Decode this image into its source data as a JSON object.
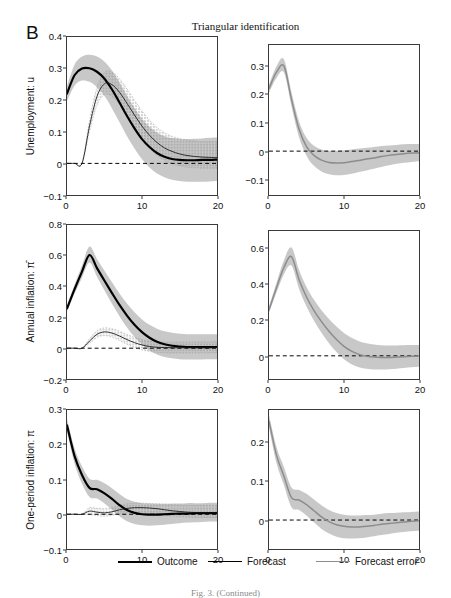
{
  "figure": {
    "panel_letter": "B",
    "title": "Triangular identification",
    "caption": "Fig. 3. (Continued)"
  },
  "legend": {
    "items": [
      {
        "label": "Outcome",
        "style": "thick-black",
        "color": "#000000"
      },
      {
        "label": "Forecast",
        "style": "thin-black",
        "color": "#000000"
      },
      {
        "label": "Forecast error",
        "style": "gray",
        "color": "#8c8c8c"
      }
    ]
  },
  "colors": {
    "outcome": "#000000",
    "forecast": "#1a1a1a",
    "error": "#8c8c8c",
    "band_solid": "#b9b9b9",
    "band_dotted": "#cfcfcf",
    "zero_line": "#000000",
    "frame": "#3a3a3a"
  },
  "chart_data": [
    {
      "id": "unemployment-outcome-forecast",
      "type": "line",
      "row": 0,
      "col": 0,
      "title": "",
      "ylabel": "Unemployment: u",
      "xlabel": "",
      "xlim": [
        0,
        20
      ],
      "ylim": [
        -0.1,
        0.4
      ],
      "xticks": [
        0,
        10,
        20
      ],
      "yticks": [
        -0.1,
        0,
        0.1,
        0.2,
        0.3,
        0.4
      ],
      "ytick_labels": [
        "−0.1",
        "0",
        "0.1",
        "0.2",
        "0.3",
        "0.4"
      ],
      "grid": false,
      "zero_line": true,
      "x": [
        0,
        1,
        2,
        3,
        4,
        5,
        6,
        7,
        8,
        9,
        10,
        11,
        12,
        13,
        14,
        15,
        16,
        17,
        18,
        19,
        20
      ],
      "series": [
        {
          "name": "Outcome",
          "style": "thick-black",
          "values": [
            0.221,
            0.279,
            0.3,
            0.301,
            0.29,
            0.268,
            0.234,
            0.193,
            0.15,
            0.111,
            0.077,
            0.052,
            0.033,
            0.021,
            0.014,
            0.011,
            0.01,
            0.01,
            0.011,
            0.011,
            0.012
          ],
          "band": {
            "type": "solid",
            "lower": [
              0.198,
              0.246,
              0.262,
              0.258,
              0.241,
              0.213,
              0.174,
              0.13,
              0.086,
              0.047,
              0.013,
              -0.013,
              -0.032,
              -0.044,
              -0.052,
              -0.056,
              -0.058,
              -0.058,
              -0.058,
              -0.057,
              -0.056
            ],
            "upper": [
              0.245,
              0.312,
              0.338,
              0.344,
              0.338,
              0.322,
              0.294,
              0.256,
              0.214,
              0.175,
              0.141,
              0.116,
              0.098,
              0.086,
              0.08,
              0.077,
              0.077,
              0.078,
              0.079,
              0.081,
              0.082
            ]
          }
        },
        {
          "name": "Forecast",
          "style": "thin-black",
          "values": [
            0.0,
            0.0,
            0.0,
            0.118,
            0.212,
            0.252,
            0.249,
            0.225,
            0.19,
            0.153,
            0.118,
            0.089,
            0.066,
            0.049,
            0.038,
            0.03,
            0.025,
            0.022,
            0.02,
            0.019,
            0.018
          ],
          "band": {
            "type": "dotted",
            "lower": [
              0.0,
              0.0,
              0.0,
              0.1,
              0.184,
              0.218,
              0.212,
              0.186,
              0.15,
              0.112,
              0.077,
              0.048,
              0.026,
              0.01,
              -0.001,
              -0.008,
              -0.012,
              -0.014,
              -0.015,
              -0.015,
              -0.015
            ],
            "upper": [
              0.0,
              0.0,
              0.0,
              0.136,
              0.241,
              0.288,
              0.289,
              0.268,
              0.236,
              0.2,
              0.166,
              0.137,
              0.114,
              0.097,
              0.086,
              0.079,
              0.074,
              0.071,
              0.069,
              0.069,
              0.069
            ]
          }
        }
      ]
    },
    {
      "id": "unemployment-forecast-error",
      "type": "line",
      "row": 0,
      "col": 1,
      "title": "",
      "ylabel": "",
      "xlabel": "",
      "xlim": [
        0,
        20
      ],
      "ylim": [
        -0.155,
        0.375
      ],
      "xticks": [
        0,
        10,
        20
      ],
      "yticks": [
        -0.1,
        0,
        0.1,
        0.2,
        0.3
      ],
      "ytick_labels": [
        "−0.1",
        "0",
        "0.1",
        "0.2",
        "0.3"
      ],
      "grid": false,
      "zero_line": true,
      "x": [
        0,
        1,
        2,
        3,
        4,
        5,
        6,
        7,
        8,
        9,
        10,
        11,
        12,
        13,
        14,
        15,
        16,
        17,
        18,
        19,
        20
      ],
      "series": [
        {
          "name": "Forecast error",
          "style": "gray",
          "values": [
            0.221,
            0.279,
            0.3,
            0.183,
            0.078,
            0.016,
            -0.015,
            -0.032,
            -0.04,
            -0.042,
            -0.041,
            -0.037,
            -0.033,
            -0.028,
            -0.024,
            -0.019,
            -0.015,
            -0.012,
            -0.009,
            -0.007,
            -0.006
          ],
          "band": {
            "type": "solid",
            "lower": [
              0.206,
              0.258,
              0.277,
              0.158,
              0.05,
              -0.016,
              -0.052,
              -0.072,
              -0.082,
              -0.085,
              -0.084,
              -0.08,
              -0.074,
              -0.068,
              -0.062,
              -0.056,
              -0.05,
              -0.045,
              -0.041,
              -0.038,
              -0.036
            ],
            "upper": [
              0.236,
              0.3,
              0.324,
              0.208,
              0.106,
              0.047,
              0.019,
              0.006,
              0.001,
              0.001,
              0.003,
              0.006,
              0.009,
              0.012,
              0.015,
              0.018,
              0.02,
              0.022,
              0.024,
              0.025,
              0.025
            ]
          }
        }
      ]
    },
    {
      "id": "annual-inflation-outcome-forecast",
      "type": "line",
      "row": 1,
      "col": 0,
      "title": "",
      "ylabel": "Annual inflation: π̄",
      "xlabel": "",
      "xlim": [
        0,
        20
      ],
      "ylim": [
        -0.2,
        0.8
      ],
      "xticks": [
        0,
        10,
        20
      ],
      "yticks": [
        -0.2,
        0,
        0.2,
        0.4,
        0.6,
        0.8
      ],
      "ytick_labels": [
        "−0.2",
        "0",
        "0.2",
        "0.4",
        "0.6",
        "0.8"
      ],
      "grid": false,
      "zero_line": true,
      "x": [
        0,
        1,
        2,
        3,
        4,
        5,
        6,
        7,
        8,
        9,
        10,
        11,
        12,
        13,
        14,
        15,
        16,
        17,
        18,
        19,
        20
      ],
      "series": [
        {
          "name": "Outcome",
          "style": "thick-black",
          "values": [
            0.258,
            0.382,
            0.497,
            0.605,
            0.52,
            0.438,
            0.358,
            0.281,
            0.212,
            0.152,
            0.104,
            0.068,
            0.042,
            0.026,
            0.016,
            0.011,
            0.008,
            0.007,
            0.007,
            0.007,
            0.008
          ],
          "band": {
            "type": "solid",
            "lower": [
              0.238,
              0.353,
              0.458,
              0.556,
              0.464,
              0.375,
              0.289,
              0.208,
              0.134,
              0.072,
              0.022,
              -0.015,
              -0.041,
              -0.057,
              -0.066,
              -0.071,
              -0.073,
              -0.073,
              -0.073,
              -0.072,
              -0.071
            ],
            "upper": [
              0.278,
              0.412,
              0.537,
              0.66,
              0.58,
              0.503,
              0.428,
              0.355,
              0.29,
              0.233,
              0.187,
              0.152,
              0.127,
              0.11,
              0.1,
              0.094,
              0.091,
              0.09,
              0.09,
              0.09,
              0.091
            ]
          }
        },
        {
          "name": "Forecast",
          "style": "thin-black",
          "values": [
            0.0,
            0.0,
            0.0,
            0.046,
            0.09,
            0.106,
            0.098,
            0.079,
            0.056,
            0.036,
            0.021,
            0.011,
            0.006,
            0.004,
            0.003,
            0.003,
            0.003,
            0.004,
            0.004,
            0.004,
            0.005
          ],
          "band": {
            "type": "dotted",
            "lower": [
              0.0,
              0.0,
              0.0,
              0.032,
              0.07,
              0.082,
              0.072,
              0.05,
              0.026,
              0.005,
              -0.011,
              -0.021,
              -0.027,
              -0.03,
              -0.031,
              -0.031,
              -0.031,
              -0.03,
              -0.03,
              -0.03,
              -0.03
            ],
            "upper": [
              0.0,
              0.0,
              0.0,
              0.062,
              0.114,
              0.132,
              0.126,
              0.11,
              0.089,
              0.07,
              0.056,
              0.047,
              0.042,
              0.04,
              0.039,
              0.039,
              0.04,
              0.04,
              0.041,
              0.041,
              0.042
            ]
          }
        }
      ]
    },
    {
      "id": "annual-inflation-forecast-error",
      "type": "line",
      "row": 1,
      "col": 1,
      "title": "",
      "ylabel": "",
      "xlabel": "",
      "xlim": [
        -0.13,
        0.7
      ],
      "ylim": [
        -0.13,
        0.7
      ],
      "xticks": [
        0,
        10,
        20
      ],
      "yticks": [
        0,
        0.2,
        0.4,
        0.6
      ],
      "ytick_labels": [
        "0",
        "0.2",
        "0.4",
        "0.6"
      ],
      "grid": false,
      "zero_line": true,
      "x": [
        0,
        1,
        2,
        3,
        4,
        5,
        6,
        7,
        8,
        9,
        10,
        11,
        12,
        13,
        14,
        15,
        16,
        17,
        18,
        19,
        20
      ],
      "series": [
        {
          "name": "Forecast error",
          "style": "gray",
          "values": [
            0.258,
            0.382,
            0.497,
            0.556,
            0.428,
            0.33,
            0.254,
            0.192,
            0.138,
            0.091,
            0.053,
            0.026,
            0.008,
            -0.002,
            -0.007,
            -0.009,
            -0.009,
            -0.007,
            -0.005,
            -0.003,
            -0.001
          ],
          "band": {
            "type": "solid",
            "lower": [
              0.24,
              0.355,
              0.458,
              0.506,
              0.376,
              0.276,
              0.197,
              0.13,
              0.071,
              0.021,
              -0.019,
              -0.047,
              -0.064,
              -0.073,
              -0.077,
              -0.077,
              -0.075,
              -0.072,
              -0.068,
              -0.064,
              -0.061
            ],
            "upper": [
              0.276,
              0.41,
              0.538,
              0.608,
              0.482,
              0.386,
              0.314,
              0.256,
              0.207,
              0.164,
              0.128,
              0.101,
              0.082,
              0.07,
              0.063,
              0.059,
              0.058,
              0.058,
              0.059,
              0.06,
              0.061
            ]
          }
        }
      ]
    },
    {
      "id": "one-period-inflation-outcome-forecast",
      "type": "line",
      "row": 2,
      "col": 0,
      "title": "",
      "ylabel": "One-period inflation: π",
      "xlabel": "",
      "xlim": [
        0,
        20
      ],
      "ylim": [
        -0.1,
        0.3
      ],
      "xticks": [
        0,
        10,
        20
      ],
      "yticks": [
        -0.1,
        0,
        0.1,
        0.2,
        0.3
      ],
      "ytick_labels": [
        "−0.1",
        "0",
        "0.1",
        "0.2",
        "0.3"
      ],
      "grid": false,
      "zero_line": true,
      "x": [
        0,
        1,
        2,
        3,
        4,
        5,
        6,
        7,
        8,
        9,
        10,
        11,
        12,
        13,
        14,
        15,
        16,
        17,
        18,
        19,
        20
      ],
      "series": [
        {
          "name": "Outcome",
          "style": "thick-black",
          "values": [
            0.256,
            0.168,
            0.113,
            0.076,
            0.072,
            0.06,
            0.044,
            0.026,
            0.012,
            0.004,
            0.0,
            -0.001,
            -0.001,
            0.0,
            0.001,
            0.002,
            0.002,
            0.003,
            0.003,
            0.003,
            0.003
          ],
          "band": {
            "type": "solid",
            "lower": [
              0.238,
              0.146,
              0.088,
              0.05,
              0.045,
              0.031,
              0.013,
              -0.006,
              -0.02,
              -0.028,
              -0.032,
              -0.033,
              -0.032,
              -0.03,
              -0.028,
              -0.026,
              -0.024,
              -0.023,
              -0.022,
              -0.021,
              -0.021
            ],
            "upper": [
              0.274,
              0.19,
              0.138,
              0.102,
              0.099,
              0.089,
              0.075,
              0.058,
              0.044,
              0.036,
              0.032,
              0.031,
              0.03,
              0.03,
              0.031,
              0.031,
              0.032,
              0.032,
              0.032,
              0.033,
              0.033
            ]
          }
        },
        {
          "name": "Forecast",
          "style": "thin-black",
          "values": [
            0.0,
            0.0,
            0.0,
            0.009,
            0.006,
            0.004,
            0.007,
            0.013,
            0.017,
            0.019,
            0.019,
            0.018,
            0.016,
            0.013,
            0.01,
            0.008,
            0.006,
            0.005,
            0.004,
            0.004,
            0.004
          ],
          "band": {
            "type": "dotted",
            "lower": [
              0.0,
              0.0,
              0.0,
              -0.001,
              -0.004,
              -0.006,
              -0.003,
              0.001,
              0.004,
              0.004,
              0.003,
              0.001,
              -0.001,
              -0.003,
              -0.005,
              -0.007,
              -0.008,
              -0.009,
              -0.009,
              -0.009,
              -0.009
            ],
            "upper": [
              0.0,
              0.0,
              0.0,
              0.019,
              0.017,
              0.016,
              0.019,
              0.026,
              0.03,
              0.032,
              0.032,
              0.031,
              0.03,
              0.029,
              0.028,
              0.027,
              0.026,
              0.026,
              0.026,
              0.026,
              0.026
            ]
          }
        }
      ]
    },
    {
      "id": "one-period-inflation-forecast-error",
      "type": "line",
      "row": 2,
      "col": 1,
      "title": "",
      "ylabel": "",
      "xlabel": "",
      "xlim": [
        0,
        20
      ],
      "ylim": [
        -0.075,
        0.285
      ],
      "xticks": [
        0,
        10,
        20
      ],
      "yticks": [
        0,
        0.1,
        0.2
      ],
      "ytick_labels": [
        "0",
        "0.1",
        "0.2"
      ],
      "grid": false,
      "zero_line": true,
      "x": [
        0,
        1,
        2,
        3,
        4,
        5,
        6,
        7,
        8,
        9,
        10,
        11,
        12,
        13,
        14,
        15,
        16,
        17,
        18,
        19,
        20
      ],
      "series": [
        {
          "name": "Forecast error",
          "style": "gray",
          "values": [
            0.256,
            0.168,
            0.113,
            0.058,
            0.052,
            0.04,
            0.024,
            0.008,
            -0.004,
            -0.012,
            -0.016,
            -0.018,
            -0.018,
            -0.016,
            -0.014,
            -0.011,
            -0.009,
            -0.007,
            -0.005,
            -0.003,
            -0.002
          ],
          "band": {
            "type": "solid",
            "lower": [
              0.24,
              0.148,
              0.09,
              0.033,
              0.026,
              0.012,
              -0.006,
              -0.023,
              -0.035,
              -0.043,
              -0.047,
              -0.048,
              -0.047,
              -0.045,
              -0.042,
              -0.039,
              -0.036,
              -0.033,
              -0.031,
              -0.029,
              -0.028
            ],
            "upper": [
              0.272,
              0.189,
              0.137,
              0.084,
              0.078,
              0.068,
              0.053,
              0.038,
              0.026,
              0.018,
              0.014,
              0.012,
              0.012,
              0.013,
              0.014,
              0.016,
              0.018,
              0.019,
              0.02,
              0.021,
              0.022
            ]
          }
        }
      ]
    }
  ]
}
